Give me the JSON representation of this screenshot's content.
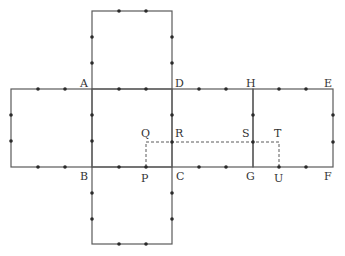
{
  "figure": {
    "type": "cube net with labeled points",
    "labels": {
      "A": {
        "text": "A",
        "x": 80,
        "y": 87
      },
      "B": {
        "text": "B",
        "x": 80,
        "y": 180
      },
      "C": {
        "text": "C",
        "x": 176,
        "y": 180
      },
      "D": {
        "text": "D",
        "x": 175,
        "y": 87
      },
      "E": {
        "text": "E",
        "x": 324,
        "y": 87
      },
      "F": {
        "text": "F",
        "x": 324,
        "y": 180
      },
      "G": {
        "text": "G",
        "x": 246,
        "y": 180
      },
      "H": {
        "text": "H",
        "x": 246,
        "y": 87
      },
      "P": {
        "text": "P",
        "x": 141,
        "y": 182
      },
      "Q": {
        "text": "Q",
        "x": 141,
        "y": 137
      },
      "R": {
        "text": "R",
        "x": 175,
        "y": 137
      },
      "S": {
        "text": "S",
        "x": 242,
        "y": 137
      },
      "T": {
        "text": "T",
        "x": 274,
        "y": 137
      },
      "U": {
        "text": "U",
        "x": 274,
        "y": 182
      }
    },
    "faces": [
      {
        "name": "top-square",
        "x1": 92,
        "y1": 11,
        "x2": 172,
        "y2": 89
      },
      {
        "name": "left-square",
        "x1": 11,
        "y1": 89,
        "x2": 92,
        "y2": 167
      },
      {
        "name": "center-square ABCD",
        "x1": 92,
        "y1": 89,
        "x2": 172,
        "y2": 167
      },
      {
        "name": "right-square DHGC",
        "x1": 172,
        "y1": 89,
        "x2": 253,
        "y2": 167
      },
      {
        "name": "far-right-square HEFG",
        "x1": 253,
        "y1": 89,
        "x2": 333,
        "y2": 167
      },
      {
        "name": "bottom-square",
        "x1": 92,
        "y1": 167,
        "x2": 172,
        "y2": 244
      }
    ],
    "dashed_path": "P-Q-R-S-T-U",
    "colors": {
      "line": "#5a5a5a",
      "dot": "#2a2a2a",
      "text": "#333333"
    }
  }
}
